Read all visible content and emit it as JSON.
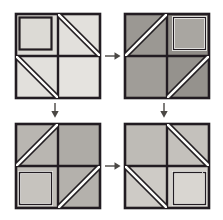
{
  "figure": {
    "background_color": "#ffffff",
    "ink_color": "#231f20",
    "stripe_color": "#fdfdfb",
    "panel_count": 4,
    "arrow_count": 4
  },
  "panels": [
    {
      "id": "panel-1",
      "name": "block-top-left",
      "position": "top-left",
      "x": 13,
      "y": 11,
      "size": 90,
      "fill": "#e2e0dc",
      "fill_alt": "#d8d6d1",
      "rotation_step": "0",
      "quadrants": [
        {
          "pos": "top-left",
          "motif": "inner-square"
        },
        {
          "pos": "top-right",
          "motif": "stripe-backslash"
        },
        {
          "pos": "bottom-left",
          "motif": "stripe-backslash"
        },
        {
          "pos": "bottom-right",
          "motif": "plain"
        }
      ]
    },
    {
      "id": "panel-2",
      "name": "block-top-right",
      "position": "top-right",
      "x": 122,
      "y": 11,
      "size": 90,
      "fill": "#9b9893",
      "fill_alt": "#908d88",
      "rotation_step": "90",
      "quadrants": [
        {
          "pos": "top-left",
          "motif": "stripe-slash"
        },
        {
          "pos": "top-right",
          "motif": "inner-square"
        },
        {
          "pos": "bottom-left",
          "motif": "plain"
        },
        {
          "pos": "bottom-right",
          "motif": "stripe-slash"
        }
      ]
    },
    {
      "id": "panel-3",
      "name": "block-bottom-left",
      "position": "bottom-left",
      "x": 13,
      "y": 121,
      "size": 90,
      "fill": "#b9b6b1",
      "fill_alt": "#aeaba6",
      "rotation_step": "180",
      "quadrants": [
        {
          "pos": "top-left",
          "motif": "stripe-slash"
        },
        {
          "pos": "top-right",
          "motif": "plain"
        },
        {
          "pos": "bottom-left",
          "motif": "inner-square"
        },
        {
          "pos": "bottom-right",
          "motif": "stripe-slash"
        }
      ]
    },
    {
      "id": "panel-4",
      "name": "block-bottom-right",
      "position": "bottom-right",
      "x": 122,
      "y": 121,
      "size": 90,
      "fill": "#c9c6c1",
      "fill_alt": "#bebbb6",
      "rotation_step": "270",
      "quadrants": [
        {
          "pos": "top-left",
          "motif": "plain"
        },
        {
          "pos": "top-right",
          "motif": "stripe-backslash"
        },
        {
          "pos": "bottom-left",
          "motif": "stripe-backslash"
        },
        {
          "pos": "bottom-right",
          "motif": "inner-square"
        }
      ]
    }
  ],
  "arrows": [
    {
      "id": "arrow-1",
      "name": "arrow-right-top",
      "direction": "right",
      "from": "panel-1",
      "to": "panel-2",
      "x": 104,
      "y": 50,
      "length": 18
    },
    {
      "id": "arrow-2",
      "name": "arrow-down-left",
      "direction": "down",
      "from": "panel-1",
      "to": "panel-3",
      "x": 54,
      "y": 102,
      "length": 17
    },
    {
      "id": "arrow-3",
      "name": "arrow-down-right",
      "direction": "down",
      "from": "panel-2",
      "to": "panel-4",
      "x": 163,
      "y": 102,
      "length": 17
    },
    {
      "id": "arrow-4",
      "name": "arrow-right-bottom",
      "direction": "right",
      "from": "panel-3",
      "to": "panel-4",
      "x": 104,
      "y": 160,
      "length": 18
    }
  ]
}
